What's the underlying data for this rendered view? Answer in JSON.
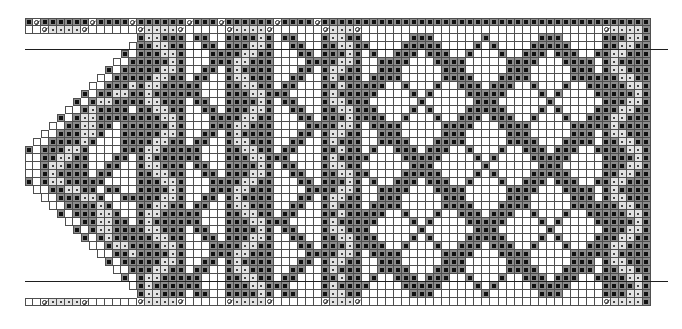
{
  "chart": {
    "kind": "knitting-colorwork-chart",
    "columns": 78,
    "row_count": 36,
    "symbols": {
      "#": "filled-square-stitch",
      "o": "dot-stitch",
      "c": "twist-stitch",
      ".": "blank-stitch",
      "-": "no-stitch"
    },
    "palette": {
      "grid_line": "#4f4f4f",
      "dark_cell": "#8c8c8c",
      "ink": "#111111",
      "dot_cell": "#e2e2e2",
      "marker_line": "#1e1e1e"
    },
    "repeat_markers_after_row": [
      3,
      32
    ],
    "rows": [
      [
        "#c######c####c",
        "######c###c######c####c#####",
        "##############################",
        "######"
      ],
      [
        "..cooooc......",
        "cooooc.....cooooc......coooc",
        "..............................",
        "coooo#"
      ],
      [
        "--------------",
        "#oo###.##..####o#.##...#oo##",
        "......###......#......###.....",
        "###oo#"
      ],
      [
        "-------------.",
        "##oo##..##.###oo#..##..##oo#",
        "#....#####....#.#....#####....",
        "##oo##"
      ],
      [
        "------------#.",
        "###oo#...####oo##...##.###o#",
        ".#..###.###..#...#..###.###..#",
        "#oo###"
      ],
      [
        "-----------..#",
        "####o#...###oo###....####oo#",
        "..####...####.....####...####.",
        "#o####"
      ],
      [
        "----------#.##",
        "###oo#..##.#o####...##.#oo##",
        "..###.....###.....###.....###.",
        "#oo###"
      ],
      [
        "---------..###",
        "##oo##.##..#oo###..##..#o###",
        ".####.....####...####.....####",
        "##oo##"
      ],
      [
        "--------..###o",
        "#oo#####...##oo##.##...##o##",
        "###..#...#..###.###..#...#..##",
        "###oo#"
      ],
      [
        "-------#.##oo#",
        "#o######...###oo###....#o###",
        "##....#.#....#####....#.#....#",
        "####o#"
      ],
      [
        "------#.#oo###",
        "#oo###.##..####o#.##...#oo##",
        "#......#......###......#......",
        "###oo#"
      ],
      [
        "-----..#o####.",
        "##oo##..##.###oo#..##..##oo#",
        "##....#.#....#####....#.#....#",
        "##oo##"
      ],
      [
        "----#.#oo#####",
        "###oo#...####oo##...##.###o#",
        "###..#...#..###.###..#...#..##",
        "#oo###"
      ],
      [
        "---..##oo##.##",
        "####o#...###oo###....####oo#",
        ".####.....####...####.....####",
        "#o####"
      ],
      [
        "--..###oo#..##",
        "###oo#..##.#o####...##.#oo##",
        "..###.....###.....###.....###.",
        "#oo###"
      ],
      [
        "-..####o#...##",
        "##oo##.##..#oo###..##..#o###",
        "..####...####.....####...####.",
        "##oo##"
      ],
      [
        "#.###oo#....##",
        "#oo#####...##oo##.##...##o##",
        ".#..###.###..#...#..###.###..#",
        "###oo#"
      ],
      [
        "..##oo##...##.",
        "#o######...###oo###....#o###",
        "#....#####....#.#....#####....",
        "####o#"
      ],
      [
        "..#oo###..##..",
        "#oo###.##..####o#.##...#oo##",
        "......###......#......###.....",
        "###oo#"
      ],
      [
        "..#o####.##...",
        "##oo##..##.###oo#..##..##oo#",
        "#....#####....#.#....#####....",
        "##oo##"
      ],
      [
        "#.#oo#####....",
        "###oo#...####oo##...##.###o#",
        ".#..###.###..#...#..###.###..#",
        "#oo###"
      ],
      [
        "-..##oo##.##..",
        "####o#...###oo###....####oo#",
        "..####...####.....####...####.",
        "#o####"
      ],
      [
        "--..###oo#..##",
        "###oo#..##.#o####...##.#oo##",
        "..###.....###.....###.....###.",
        "#oo###"
      ],
      [
        "---..####o#...",
        "##oo##.##..#oo###..##..#o###",
        ".####.....####...####.....####",
        "##oo##"
      ],
      [
        "----#.###oo#..",
        "#oo#####...##oo##.##...##o##",
        "###..#...#..###.###..#...#..##",
        "###oo#"
      ],
      [
        "-----..##oo##.",
        "#o######...###oo###....#o###",
        "##....#.#....#####....#.#....#",
        "####o#"
      ],
      [
        "------#.#oo###",
        "#oo###.##..####o#.##...#oo##",
        "#......#......###......#......",
        "###oo#"
      ],
      [
        "-------#.#o###",
        "##oo##..##.###oo#..##..##oo#",
        "##....#.#....#####....#.#....#",
        "##oo##"
      ],
      [
        "--------..#oo#",
        "###oo#...####oo##...##.###o#",
        "###..#...#..###.###..#...#..##",
        "#oo###"
      ],
      [
        "---------..##o",
        "####o#...###oo###....####oo#",
        ".####.....####...####.....####",
        "#o####"
      ],
      [
        "----------#.##",
        "###oo#..##.#o####...##.#oo##",
        "..###.....###.....###.....###.",
        "#oo###"
      ],
      [
        "-----------..#",
        "##oo##.##..#oo###..##..#o###",
        "..####...####.....####...####.",
        "##oo##"
      ],
      [
        "------------#.",
        "#oo#####...##oo##.##...##o##",
        ".#..###.###..#...#..###.###..#",
        "###oo#"
      ],
      [
        "-------------.",
        "#o######...###oo###....#o###",
        "#....#####....#.#....#####....",
        "####o#"
      ],
      [
        "--------------",
        "#oo###.##..####o#.##...#oo##",
        "......###......#......###.....",
        "###oo#"
      ],
      [
        "..cooooc......",
        "cooooc.....cooooc......coooc",
        "..............................",
        "coooo#"
      ]
    ]
  }
}
